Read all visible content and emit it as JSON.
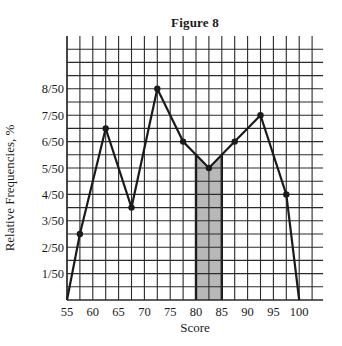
{
  "chart_data": {
    "type": "line",
    "title": "Figure 8",
    "xlabel": "Score",
    "ylabel": "Relative Frequencies, %",
    "x_tick_labels": [
      "55",
      "60",
      "65",
      "70",
      "75",
      "80",
      "85",
      "90",
      "95",
      "100"
    ],
    "x_ticks": [
      55,
      60,
      65,
      70,
      75,
      80,
      85,
      90,
      95,
      100
    ],
    "y_tick_labels": [
      "1/50",
      "2/50",
      "3/50",
      "4/50",
      "5/50",
      "6/50",
      "7/50",
      "8/50"
    ],
    "y_ticks": [
      1,
      2,
      3,
      4,
      5,
      6,
      7,
      8
    ],
    "y_unit": "fiftieths",
    "xlim": [
      55,
      102.5
    ],
    "ylim": [
      0,
      9.5
    ],
    "grid": true,
    "grid_x_step": 2.5,
    "grid_y_step": 0.5,
    "series": [
      {
        "name": "Frequency polygon",
        "x": [
          55,
          57.5,
          62.5,
          67.5,
          72.5,
          77.5,
          82.5,
          87.5,
          92.5,
          97.5,
          100
        ],
        "y": [
          0,
          2.5,
          6.5,
          3.5,
          8,
          6,
          5,
          6,
          7,
          4,
          0
        ],
        "y_labels": [
          "0",
          "2.5/50",
          "6.5/50",
          "3.5/50",
          "8/50",
          "6/50",
          "5/50",
          "6/50",
          "7/50",
          "4/50",
          "0"
        ],
        "markers": [
          false,
          true,
          true,
          true,
          true,
          true,
          true,
          true,
          true,
          true,
          false
        ]
      }
    ],
    "annotations": [
      {
        "type": "shaded_region",
        "description": "Area under polygon between scores 80 and 85",
        "x_start": 80,
        "x_end": 85,
        "color": "#b8b8b8"
      }
    ]
  },
  "style": {
    "line_color": "#1a1a1a",
    "grid_color": "#2a2a2a",
    "shade_color": "#b8b8b8",
    "background": "#ffffff"
  }
}
